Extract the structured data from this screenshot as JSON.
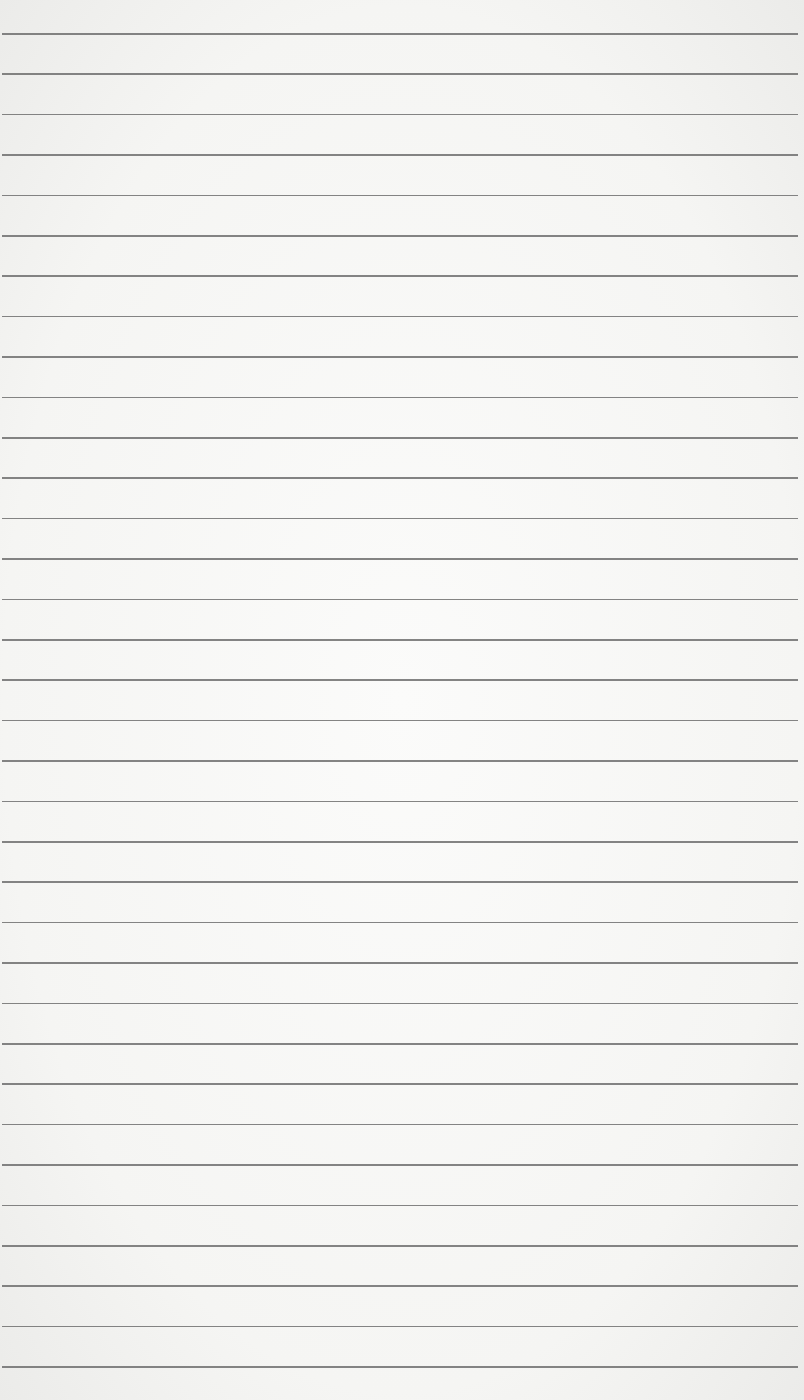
{
  "paper": {
    "type": "lined-paper",
    "background_color": "#f6f6f4",
    "line_color": "#6f6f6f",
    "first_line_y": 33,
    "line_spacing": 40.4,
    "line_count": 34
  }
}
